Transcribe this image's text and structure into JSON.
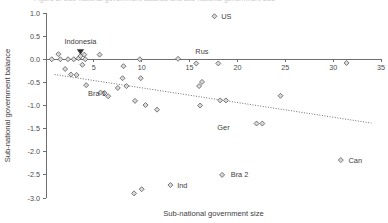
{
  "figure": {
    "background_color": "#ffffff",
    "width": 388,
    "height": 223,
    "cropped_caption_above": "Figure 5. Sub-national government balance and sub-national government size"
  },
  "chart_data": {
    "type": "scatter",
    "title": "",
    "xlabel": "Sub-national government size",
    "ylabel": "Sub-national government balance",
    "xlim": [
      0,
      35
    ],
    "ylim": [
      -3.0,
      1.0
    ],
    "xticks": [
      5,
      10,
      15,
      20,
      25,
      30,
      35
    ],
    "xtick_labels": [
      "5",
      "10",
      "15",
      "20",
      "25",
      "30",
      "35"
    ],
    "yticks": [
      1.0,
      0.5,
      0.0,
      -0.5,
      -1.0,
      -1.5,
      -2.0,
      -2.5,
      -3.0
    ],
    "ytick_labels": [
      "1.0",
      "0.5",
      "0.0",
      "-0.5",
      "-1.0",
      "-1.5",
      "-2.0",
      "-2.5",
      "-3.0"
    ],
    "grid": false,
    "legend": "none",
    "marker_shape": "diamond",
    "marker_fill": "#d9d9d9",
    "marker_edge": "#5a5a5a",
    "zero_line_y": 0.0,
    "points": [
      {
        "x": 0.6,
        "y": 0.0,
        "label": ""
      },
      {
        "x": 1.3,
        "y": 0.11,
        "label": ""
      },
      {
        "x": 1.5,
        "y": 0.0,
        "label": ""
      },
      {
        "x": 2.0,
        "y": -0.21,
        "label": ""
      },
      {
        "x": 2.3,
        "y": 0.0,
        "label": ""
      },
      {
        "x": 2.6,
        "y": -0.33,
        "label": ""
      },
      {
        "x": 2.9,
        "y": 0.0,
        "label": ""
      },
      {
        "x": 3.2,
        "y": -0.34,
        "label": ""
      },
      {
        "x": 3.4,
        "y": 0.02,
        "label": ""
      },
      {
        "x": 3.6,
        "y": 0.07,
        "label": "Indonesia"
      },
      {
        "x": 3.8,
        "y": -0.12,
        "label": ""
      },
      {
        "x": 4.0,
        "y": 0.1,
        "label": ""
      },
      {
        "x": 4.1,
        "y": 0.0,
        "label": ""
      },
      {
        "x": 4.2,
        "y": -0.56,
        "label": ""
      },
      {
        "x": 5.6,
        "y": 0.1,
        "label": ""
      },
      {
        "x": 5.7,
        "y": -0.72,
        "label": "Bra 1"
      },
      {
        "x": 6.1,
        "y": -0.73,
        "label": ""
      },
      {
        "x": 6.5,
        "y": -0.8,
        "label": ""
      },
      {
        "x": 7.5,
        "y": -0.62,
        "label": ""
      },
      {
        "x": 8.0,
        "y": -0.41,
        "label": ""
      },
      {
        "x": 8.1,
        "y": -0.15,
        "label": ""
      },
      {
        "x": 8.4,
        "y": -0.58,
        "label": ""
      },
      {
        "x": 9.3,
        "y": -0.9,
        "label": ""
      },
      {
        "x": 9.8,
        "y": 0.0,
        "label": ""
      },
      {
        "x": 9.9,
        "y": -0.41,
        "label": ""
      },
      {
        "x": 10.4,
        "y": -0.99,
        "label": ""
      },
      {
        "x": 11.6,
        "y": -1.09,
        "label": ""
      },
      {
        "x": 13.8,
        "y": 0.01,
        "label": ""
      },
      {
        "x": 15.7,
        "y": -0.09,
        "label": "Rus"
      },
      {
        "x": 16.0,
        "y": -0.58,
        "label": ""
      },
      {
        "x": 16.3,
        "y": -0.49,
        "label": ""
      },
      {
        "x": 16.1,
        "y": -1.0,
        "label": ""
      },
      {
        "x": 17.6,
        "y": 0.93,
        "label": "US"
      },
      {
        "x": 18.0,
        "y": -0.09,
        "label": ""
      },
      {
        "x": 18.2,
        "y": -0.89,
        "label": ""
      },
      {
        "x": 18.8,
        "y": -0.89,
        "label": "Ger"
      },
      {
        "x": 22.0,
        "y": -1.39,
        "label": ""
      },
      {
        "x": 22.6,
        "y": -1.39,
        "label": ""
      },
      {
        "x": 24.5,
        "y": -0.79,
        "label": ""
      },
      {
        "x": 31.4,
        "y": -0.08,
        "label": ""
      },
      {
        "x": 30.8,
        "y": -2.18,
        "label": "Can"
      },
      {
        "x": 18.4,
        "y": -2.5,
        "label": "Bra 2"
      },
      {
        "x": 13.0,
        "y": -2.72,
        "label": "Ind"
      },
      {
        "x": 10.0,
        "y": -2.81,
        "label": ""
      },
      {
        "x": 9.2,
        "y": -2.9,
        "label": ""
      }
    ],
    "annotations": [
      {
        "text": "Indonesia",
        "x": 3.6,
        "y": 0.32,
        "marker": "triangle-down"
      },
      {
        "text": "US",
        "x": 18.3,
        "y": 0.93,
        "marker": "none"
      },
      {
        "text": "Rus",
        "x": 15.6,
        "y": 0.16,
        "marker": "none"
      },
      {
        "text": "Bra 1",
        "x": 4.4,
        "y": -0.74,
        "marker": "none"
      },
      {
        "text": "Ger",
        "x": 17.9,
        "y": -1.47,
        "marker": "none"
      },
      {
        "text": "Can",
        "x": 31.6,
        "y": -2.18,
        "marker": "none"
      },
      {
        "text": "Bra 2",
        "x": 19.3,
        "y": -2.5,
        "marker": "none"
      },
      {
        "text": "Ind",
        "x": 13.7,
        "y": -2.72,
        "marker": "none"
      }
    ],
    "trend_line": {
      "style": "dotted",
      "x_start": 0.9,
      "y_start": -0.33,
      "x_end": 34.0,
      "y_end": -1.38
    }
  }
}
